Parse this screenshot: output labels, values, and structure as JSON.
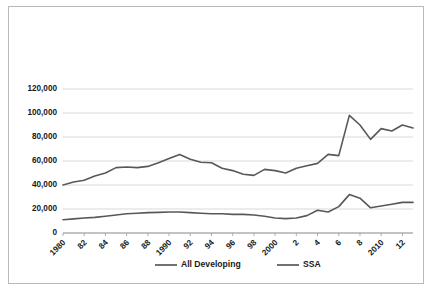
{
  "chart_data": {
    "type": "line",
    "title": "",
    "xlabel": "",
    "ylabel": "",
    "ylim": [
      0,
      130000
    ],
    "yticks": [
      0,
      20000,
      40000,
      60000,
      80000,
      100000,
      120000
    ],
    "ytick_labels": [
      "0",
      "20,000",
      "40,000",
      "60,000",
      "80,000",
      "100,000",
      "120,000"
    ],
    "grid": true,
    "legend_position": "bottom",
    "x": [
      1980,
      1981,
      1982,
      1983,
      1984,
      1985,
      1986,
      1987,
      1988,
      1989,
      1990,
      1991,
      1992,
      1993,
      1994,
      1995,
      1996,
      1997,
      1998,
      1999,
      2000,
      2001,
      2002,
      2003,
      2004,
      2005,
      2006,
      2007,
      2008,
      2009,
      2010,
      2011,
      2012,
      2013
    ],
    "xtick_values": [
      1980,
      1982,
      1984,
      1986,
      1988,
      1990,
      1992,
      1994,
      1996,
      1998,
      2000,
      2002,
      2004,
      2006,
      2008,
      2010,
      2012
    ],
    "xtick_labels": [
      "1980",
      "82",
      "84",
      "86",
      "88",
      "1990",
      "92",
      "94",
      "96",
      "98",
      "2000",
      "2",
      "4",
      "6",
      "8",
      "2010",
      "12"
    ],
    "series": [
      {
        "name": "All Developing",
        "color": "#585858",
        "values": [
          40000,
          42500,
          44000,
          47500,
          50000,
          54500,
          55000,
          54500,
          55500,
          58500,
          62000,
          65500,
          61500,
          59000,
          58500,
          54000,
          52000,
          49000,
          48000,
          53000,
          52000,
          50000,
          54000,
          56000,
          58000,
          65500,
          64500,
          98000,
          90000,
          78000,
          87000,
          85000,
          90000,
          87500
        ]
      },
      {
        "name": "SSA",
        "color": "#585858",
        "values": [
          11000,
          11800,
          12500,
          13000,
          14000,
          15000,
          16000,
          16500,
          17000,
          17200,
          17500,
          17500,
          17000,
          16500,
          16000,
          16000,
          15500,
          15500,
          15000,
          14000,
          12500,
          12000,
          12500,
          14500,
          19000,
          17500,
          22000,
          32000,
          29000,
          21000,
          22500,
          24000,
          25500,
          25500
        ]
      }
    ]
  },
  "legend": {
    "items": [
      {
        "label": "All Developing"
      },
      {
        "label": "SSA"
      }
    ]
  }
}
